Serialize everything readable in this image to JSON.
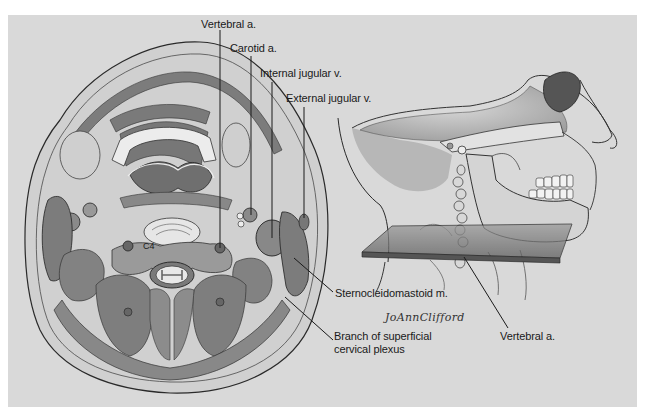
{
  "figure": {
    "background": "#d9d9d9",
    "panels": [
      {
        "name": "cross-section",
        "description": "Axial cross-section of the neck at the C4 level"
      },
      {
        "name": "lateral-skull",
        "description": "Lateral view of skull and neck showing the section plane"
      }
    ],
    "vertebra_label": "C4",
    "signature": "JoAnnClifford"
  },
  "labels": {
    "vertebral_a_top": "Vertebral a.",
    "carotid_a": "Carotid a.",
    "internal_jugular_v": "Internal jugular v.",
    "external_jugular_v": "External jugular v.",
    "sternocleidomastoid_m": "Sternocleidomastoid m.",
    "branch_line1": "Branch of superficial",
    "branch_line2": "cervical plexus",
    "vertebral_a_right": "Vertebral a."
  },
  "colors": {
    "muscle": "#8a8a8a",
    "muscle_dark": "#6e6e6e",
    "tissue_light": "#c4c4c4",
    "line": "#1a1a1a"
  }
}
